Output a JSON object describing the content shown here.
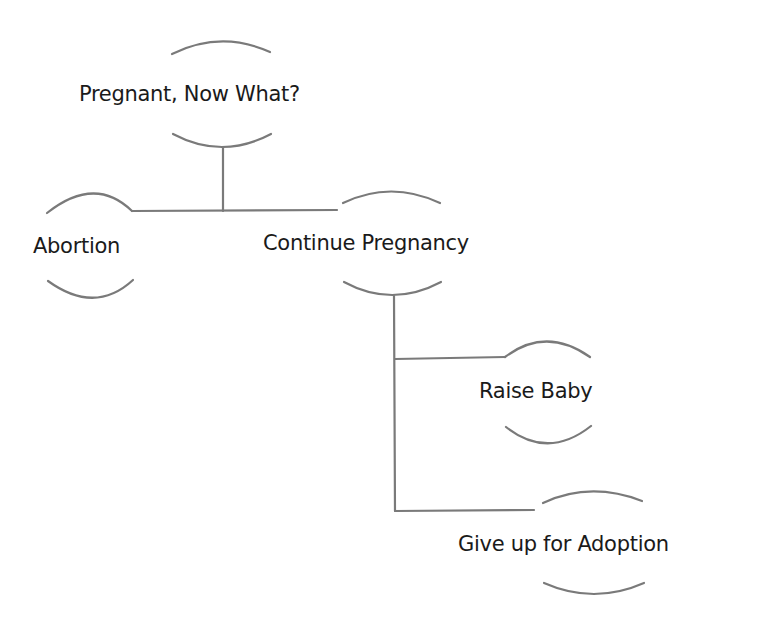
{
  "diagram": {
    "type": "decision-tree",
    "root": {
      "label": "Pregnant, Now What?",
      "children": [
        {
          "label": "Abortion"
        },
        {
          "label": "Continue Pregnancy",
          "children": [
            {
              "label": "Raise Baby"
            },
            {
              "label": "Give up for Adoption"
            }
          ]
        }
      ]
    },
    "nodes": {
      "root": "Pregnant, Now What?",
      "abortion": "Abortion",
      "continue": "Continue Pregnancy",
      "raise": "Raise Baby",
      "adoption": "Give up for Adoption"
    },
    "colors": {
      "line": "#7a7a7a",
      "text": "#1a1a1a",
      "background": "#ffffff"
    }
  }
}
